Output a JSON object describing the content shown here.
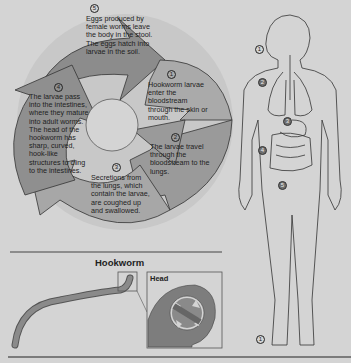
{
  "figure": {
    "cycle": {
      "steps": [
        {
          "number": "1",
          "text": "Hookworm larvae enter the bloodstream through the skin or mouth."
        },
        {
          "number": "2",
          "text": "The larvae travel through the bloodstream to the lungs."
        },
        {
          "number": "3",
          "text": "Secretions from the lungs, which contain the larvae, are coughed up and swallowed."
        },
        {
          "number": "4",
          "text": "The larvae pass into the intestines, where they mature into adult worms. The head of the hookworm has sharp, curved, hook-like structures to cling to the intestines."
        },
        {
          "number": "5",
          "text": "Eggs produced by female worms leave the body in the stool. The eggs hatch into larvae in the soil."
        }
      ]
    },
    "body_markers": [
      {
        "number": "1",
        "location": "mouth"
      },
      {
        "number": "2",
        "location": "lungs"
      },
      {
        "number": "3",
        "location": "stomach"
      },
      {
        "number": "4",
        "location": "intestines"
      },
      {
        "number": "5",
        "location": "lower abdomen"
      },
      {
        "number": "1",
        "location": "foot"
      }
    ],
    "hookworm_panel": {
      "title": "Hookworm",
      "inset_label": "Head"
    },
    "colors": {
      "background": "#d4d4d4",
      "arrow_dark": "#8a8a8a",
      "arrow_mid": "#a3a3a3",
      "arrow_light": "#b9b9b9",
      "outline": "#333333",
      "worm": "#7d7d7d"
    }
  }
}
